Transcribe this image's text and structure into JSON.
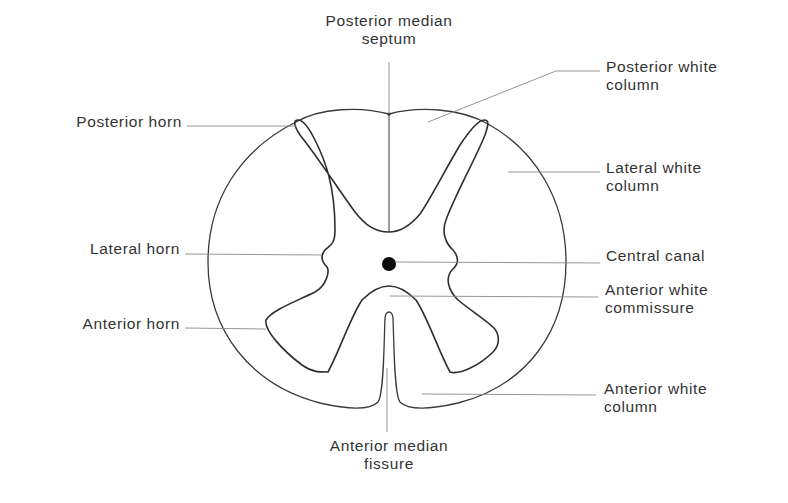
{
  "colors": {
    "outline": "#3a3a3a",
    "leader_line": "#8a8a8a",
    "text": "#333333",
    "background": "#ffffff"
  },
  "labels": {
    "posterior_median_septum": {
      "line1": "Posterior median",
      "line2": "septum"
    },
    "posterior_white_column": {
      "line1": "Posterior white",
      "line2": "column"
    },
    "posterior_horn": {
      "line1": "Posterior horn"
    },
    "lateral_white_column": {
      "line1": "Lateral white",
      "line2": "column"
    },
    "lateral_horn": {
      "line1": "Lateral horn"
    },
    "central_canal": {
      "line1": "Central canal"
    },
    "anterior_white_commissure": {
      "line1": "Anterior white",
      "line2": "commissure"
    },
    "anterior_horn": {
      "line1": "Anterior horn"
    },
    "anterior_white_column": {
      "line1": "Anterior white",
      "line2": "column"
    },
    "anterior_median_fissure": {
      "line1": "Anterior median",
      "line2": "fissure"
    }
  }
}
